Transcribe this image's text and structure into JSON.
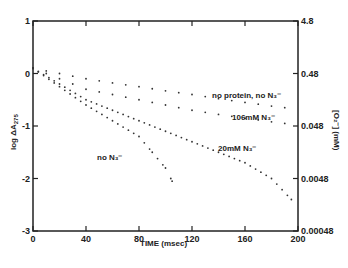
{
  "chart_data": {
    "type": "scatter",
    "title": "",
    "xlabel": "TIME (msec)",
    "ylabel": "log ΔA275",
    "ylabel_right": "[O2⁻] (mM)",
    "xlim": [
      0,
      200
    ],
    "ylim": [
      -3,
      1
    ],
    "x_ticks": [
      "0",
      "40",
      "80",
      "120",
      "160",
      "200"
    ],
    "y_ticks": [
      "1",
      "0",
      "-1",
      "-2",
      "-3"
    ],
    "y_right_ticks": [
      "4.8",
      "0.48",
      "0.048",
      "0.0048",
      "0.00048"
    ],
    "grid": false,
    "legend_position": "inline annotations",
    "series": [
      {
        "name": "no protein, no N3⁻",
        "x": [
          0,
          20,
          40,
          60,
          80,
          100,
          120,
          140,
          160,
          180,
          190
        ],
        "y": [
          0.1,
          0.0,
          -0.1,
          -0.18,
          -0.25,
          -0.33,
          -0.4,
          -0.48,
          -0.55,
          -0.62,
          -0.65
        ]
      },
      {
        "name": "106mM N3⁻",
        "x": [
          0,
          20,
          40,
          60,
          80,
          100,
          120,
          140,
          160,
          180,
          190
        ],
        "y": [
          0.1,
          -0.1,
          -0.3,
          -0.4,
          -0.5,
          -0.6,
          -0.7,
          -0.78,
          -0.85,
          -0.92,
          -0.95
        ]
      },
      {
        "name": "20mM N3⁻",
        "x": [
          0,
          20,
          40,
          60,
          80,
          100,
          120,
          140,
          160,
          180,
          195
        ],
        "y": [
          0.1,
          -0.2,
          -0.5,
          -0.7,
          -0.9,
          -1.1,
          -1.3,
          -1.5,
          -1.7,
          -2.0,
          -2.4
        ]
      },
      {
        "name": "no N3⁻",
        "x": [
          0,
          20,
          40,
          60,
          80,
          90,
          100,
          105
        ],
        "y": [
          0.1,
          -0.25,
          -0.6,
          -0.9,
          -1.2,
          -1.5,
          -1.8,
          -2.05
        ]
      }
    ]
  },
  "labels": {
    "xlabel": "TIME (msec)",
    "ylabel": "log ΔA",
    "ylabel_sub": "275",
    "ylabel_right": "[O₂⁻] (mM)",
    "s1": "no protein, no N₃⁻",
    "s2": "106mM N₃⁻",
    "s3": "20mM N₃⁻",
    "s4": "no N₃⁻"
  }
}
